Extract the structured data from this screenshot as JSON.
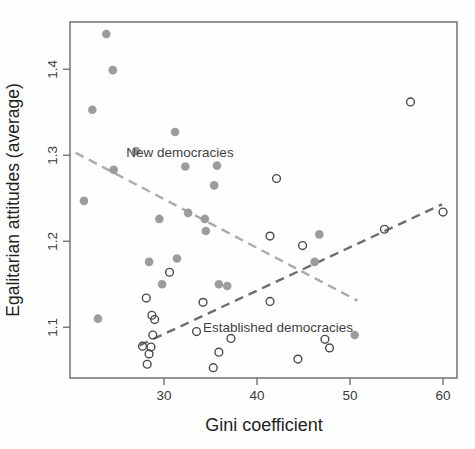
{
  "figure": {
    "xlabel": "Gini coefficient",
    "ylabel": "Egalitarian attitudes (average)"
  },
  "chart_data": {
    "type": "scatter",
    "title": "",
    "xlabel": "Gini coefficient",
    "ylabel": "Egalitarian attitudes (average)",
    "xlim": [
      19.9,
      61.5
    ],
    "ylim": [
      1.041,
      1.455
    ],
    "x_ticks": [
      "30",
      "40",
      "50",
      "60"
    ],
    "x_tick_values": [
      30,
      40,
      50,
      60
    ],
    "y_ticks": [
      "1.1",
      "1.2",
      "1.3",
      "1.4"
    ],
    "y_tick_values": [
      1.1,
      1.2,
      1.3,
      1.4
    ],
    "grid": false,
    "legend_position": "inline-annotations",
    "colors": {
      "filled_point": "#9c9c9c",
      "open_point_stroke": "#4a4a4a",
      "new_trend": "#ababab",
      "established_trend": "#6e6e6e",
      "frame": "#7a7a7a"
    },
    "series": [
      {
        "name": "New democracies",
        "marker": "filled-circle",
        "color": "#9c9c9c",
        "points": [
          [
            23.8,
            1.441
          ],
          [
            24.5,
            1.399
          ],
          [
            22.3,
            1.353
          ],
          [
            31.2,
            1.327
          ],
          [
            27.0,
            1.305
          ],
          [
            24.6,
            1.283
          ],
          [
            32.3,
            1.287
          ],
          [
            35.7,
            1.288
          ],
          [
            35.4,
            1.265
          ],
          [
            21.4,
            1.247
          ],
          [
            29.5,
            1.226
          ],
          [
            32.6,
            1.233
          ],
          [
            34.4,
            1.226
          ],
          [
            34.5,
            1.212
          ],
          [
            28.4,
            1.176
          ],
          [
            31.4,
            1.18
          ],
          [
            29.8,
            1.15
          ],
          [
            35.9,
            1.15
          ],
          [
            36.8,
            1.148
          ],
          [
            46.7,
            1.208
          ],
          [
            46.2,
            1.176
          ],
          [
            22.9,
            1.11
          ],
          [
            50.5,
            1.091
          ]
        ]
      },
      {
        "name": "Established democracies",
        "marker": "open-circle",
        "color": "#4a4a4a",
        "points": [
          [
            56.5,
            1.362
          ],
          [
            42.1,
            1.273
          ],
          [
            41.4,
            1.206
          ],
          [
            44.9,
            1.195
          ],
          [
            53.7,
            1.214
          ],
          [
            60.0,
            1.234
          ],
          [
            30.6,
            1.164
          ],
          [
            28.1,
            1.134
          ],
          [
            28.7,
            1.114
          ],
          [
            29.0,
            1.109
          ],
          [
            28.8,
            1.091
          ],
          [
            27.7,
            1.078
          ],
          [
            28.6,
            1.077
          ],
          [
            28.4,
            1.069
          ],
          [
            28.2,
            1.057
          ],
          [
            33.5,
            1.095
          ],
          [
            34.2,
            1.129
          ],
          [
            41.4,
            1.13
          ],
          [
            37.2,
            1.087
          ],
          [
            35.9,
            1.071
          ],
          [
            35.3,
            1.053
          ],
          [
            44.4,
            1.063
          ],
          [
            47.3,
            1.086
          ],
          [
            47.8,
            1.076
          ]
        ]
      }
    ],
    "trend_lines": [
      {
        "series": "New democracies",
        "style": "dashed",
        "color": "#ababab",
        "x1": 20.5,
        "y1": 1.303,
        "x2": 50.8,
        "y2": 1.131
      },
      {
        "series": "Established democracies",
        "style": "dashed",
        "color": "#6e6e6e",
        "x1": 27.4,
        "y1": 1.079,
        "x2": 59.9,
        "y2": 1.243
      }
    ],
    "annotations": [
      {
        "text": "New democracies",
        "x": 31.7,
        "y": 1.3035
      },
      {
        "text": "Established democracies",
        "x": 42.3,
        "y": 1.0985
      }
    ]
  }
}
